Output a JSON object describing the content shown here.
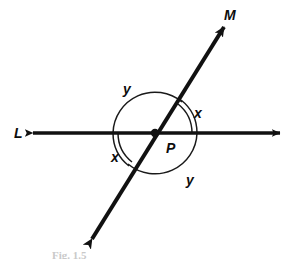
{
  "figure": {
    "caption": "Fig. 1.5",
    "background_color": "#ffffff",
    "ink_color": "#111111",
    "width": 299,
    "height": 259
  },
  "lines": [
    {
      "id": "line-L",
      "label": "L",
      "kind": "double-headed-arrow",
      "orientation": "horizontal",
      "label_x": 14,
      "label_y": 126
    },
    {
      "id": "line-M",
      "label": "M",
      "kind": "double-headed-arrow",
      "orientation": "diagonal",
      "label_x": 224,
      "label_y": 8
    }
  ],
  "point": {
    "label": "P",
    "label_x": 166,
    "label_y": 141,
    "x": 155,
    "y": 133
  },
  "angles": [
    {
      "id": "angle-y-upper-left",
      "label": "y",
      "marks": 1,
      "label_x": 123,
      "label_y": 82
    },
    {
      "id": "angle-x-upper-right",
      "label": "x",
      "marks": 2,
      "label_x": 194,
      "label_y": 106
    },
    {
      "id": "angle-x-lower-left",
      "label": "x",
      "marks": 2,
      "label_x": 111,
      "label_y": 150
    },
    {
      "id": "angle-y-lower-right",
      "label": "y",
      "marks": 1,
      "label_x": 186,
      "label_y": 173
    }
  ]
}
